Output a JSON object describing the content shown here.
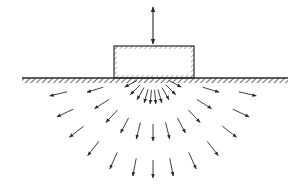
{
  "diagram": {
    "colors": {
      "ink": "#2a2a2a",
      "background": "#ffffff"
    },
    "load_arrow": {
      "x": 153,
      "y_top": 7,
      "y_bottom": 44,
      "type": "double-headed",
      "meaning": "vertical oscillating load"
    },
    "foundation_block": {
      "x": 114,
      "y": 46,
      "width": 80,
      "height": 32,
      "hatched_inner_edges": true
    },
    "ground_surface": {
      "x1": 22,
      "x2": 288,
      "y": 78,
      "hatch_depth": 5
    },
    "wave_source": {
      "cx": 153,
      "cy": 72
    },
    "arrow_arcs": [
      {
        "name": "inner",
        "radius": 18,
        "arrow_length": 14,
        "angles_deg": [
          -62,
          -45,
          -30,
          -16,
          -5,
          5,
          16,
          30,
          45,
          62
        ]
      },
      {
        "name": "middle",
        "radius": 52,
        "arrow_length": 17,
        "angles_deg": [
          -73,
          -58,
          -43,
          -28,
          -14,
          0,
          14,
          28,
          43,
          58,
          73
        ]
      },
      {
        "name": "outer",
        "radius": 88,
        "arrow_length": 18,
        "angles_deg": [
          -77,
          -65,
          -52,
          -38,
          -24,
          -11,
          0,
          11,
          24,
          38,
          52,
          65,
          77
        ]
      }
    ]
  }
}
